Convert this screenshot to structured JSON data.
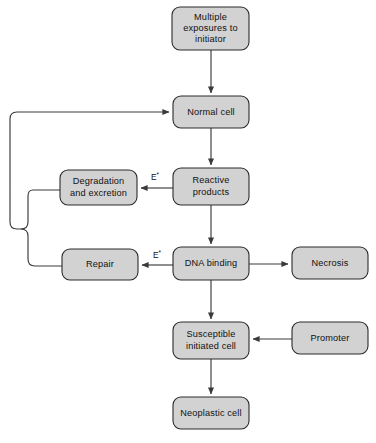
{
  "diagram": {
    "colors": {
      "node_fill": "#d2d2d2",
      "node_stroke": "#2b2b2b",
      "edge_stroke": "#3a3a3a",
      "text": "#111111",
      "background": "#ffffff"
    },
    "nodes": [
      {
        "id": "multiple-exposures",
        "label": "Multiple exposures to initiator",
        "lines": [
          "Multiple",
          "exposures to",
          "initiator"
        ],
        "x": 172,
        "y": 7,
        "w": 77,
        "h": 43
      },
      {
        "id": "normal-cell",
        "label": "Normal cell",
        "lines": [
          "Normal cell"
        ],
        "x": 173,
        "y": 96,
        "w": 76,
        "h": 32
      },
      {
        "id": "reactive-products",
        "label": "Reactive products",
        "lines": [
          "Reactive",
          "products"
        ],
        "x": 173,
        "y": 168,
        "w": 76,
        "h": 37
      },
      {
        "id": "degradation-excretion",
        "label": "Degradation and excretion",
        "lines": [
          "Degradation",
          "and excretion"
        ],
        "x": 60,
        "y": 170,
        "w": 77,
        "h": 35
      },
      {
        "id": "dna-binding",
        "label": "DNA binding",
        "lines": [
          "DNA binding"
        ],
        "x": 173,
        "y": 247,
        "w": 76,
        "h": 33
      },
      {
        "id": "repair",
        "label": "Repair",
        "lines": [
          "Repair"
        ],
        "x": 62,
        "y": 249,
        "w": 76,
        "h": 31
      },
      {
        "id": "necrosis",
        "label": "Necrosis",
        "lines": [
          "Necrosis"
        ],
        "x": 292,
        "y": 247,
        "w": 76,
        "h": 32
      },
      {
        "id": "susceptible-initiated-cell",
        "label": "Susceptible initiated cell",
        "lines": [
          "Susceptible",
          "initiated cell"
        ],
        "x": 173,
        "y": 322,
        "w": 76,
        "h": 37
      },
      {
        "id": "promoter",
        "label": "Promoter",
        "lines": [
          "Promoter"
        ],
        "x": 292,
        "y": 322,
        "w": 76,
        "h": 32
      },
      {
        "id": "neoplastic-cell",
        "label": "Neoplastic cell",
        "lines": [
          "Neoplastic cell"
        ],
        "x": 173,
        "y": 397,
        "w": 76,
        "h": 32
      }
    ],
    "edges": [
      {
        "id": "exposures-to-normal",
        "from": "multiple-exposures",
        "to": "normal-cell",
        "label": ""
      },
      {
        "id": "normal-to-reactive",
        "from": "normal-cell",
        "to": "reactive-products",
        "label": ""
      },
      {
        "id": "reactive-to-degradation",
        "from": "reactive-products",
        "to": "degradation-excretion",
        "label": "E*"
      },
      {
        "id": "reactive-to-dna",
        "from": "reactive-products",
        "to": "dna-binding",
        "label": ""
      },
      {
        "id": "dna-to-repair",
        "from": "dna-binding",
        "to": "repair",
        "label": "E*"
      },
      {
        "id": "dna-to-necrosis",
        "from": "dna-binding",
        "to": "necrosis",
        "label": ""
      },
      {
        "id": "dna-to-susceptible",
        "from": "dna-binding",
        "to": "susceptible-initiated-cell",
        "label": ""
      },
      {
        "id": "promoter-to-susceptible",
        "from": "promoter",
        "to": "susceptible-initiated-cell",
        "label": ""
      },
      {
        "id": "susceptible-to-neoplastic",
        "from": "susceptible-initiated-cell",
        "to": "neoplastic-cell",
        "label": ""
      },
      {
        "id": "degradation-feedback-to-normal",
        "from": "degradation-excretion",
        "to": "normal-cell",
        "label": ""
      },
      {
        "id": "repair-feedback-to-normal",
        "from": "repair",
        "to": "normal-cell",
        "label": ""
      }
    ],
    "edge_labels": [
      {
        "id": "e-star-degradation",
        "base": "E",
        "sup": "*",
        "x": 155,
        "y": 177
      },
      {
        "id": "e-star-repair",
        "base": "E",
        "sup": "*",
        "x": 157,
        "y": 255
      }
    ]
  }
}
